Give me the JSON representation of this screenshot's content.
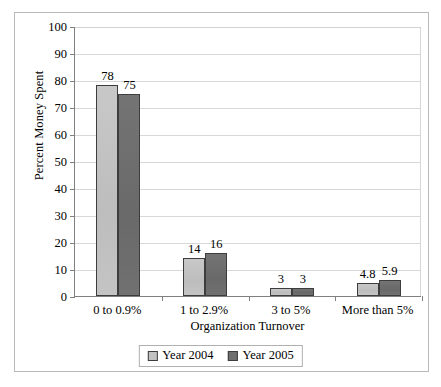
{
  "chart_data": {
    "type": "bar",
    "title": "",
    "subtitle": "",
    "xlabel": "Organization Turnover",
    "ylabel": "Percent Money Spent",
    "categories": [
      "0 to 0.9%",
      "1 to 2.9%",
      "3 to 5%",
      "More than 5%"
    ],
    "series": [
      {
        "name": "Year 2004",
        "color": "#c2c2c2",
        "values": [
          78,
          14,
          3,
          4.8
        ],
        "labels": [
          "78",
          "14",
          "3",
          "4.8"
        ]
      },
      {
        "name": "Year 2005",
        "color": "#6f6f6f",
        "values": [
          75,
          16,
          3,
          5.9
        ],
        "labels": [
          "75",
          "16",
          "3",
          "5.9"
        ]
      }
    ],
    "ylim": [
      0,
      100
    ],
    "ytick_step": 10,
    "yticks": [
      100,
      90,
      80,
      70,
      60,
      50,
      40,
      30,
      20,
      10,
      0
    ],
    "ytick_labels": [
      "100",
      "90",
      "80",
      "70",
      "60",
      "50",
      "40",
      "30",
      "20",
      "10",
      "0"
    ],
    "grid": true,
    "grid_axis": "y",
    "grid_color": "#d8d8d8",
    "legend_position": "bottom",
    "bar_orientation": "vertical",
    "grouping": "clustered",
    "plot_background": "#ffffff",
    "axis_color": "#808080",
    "bar_edge_color": "#3d3d3d"
  }
}
